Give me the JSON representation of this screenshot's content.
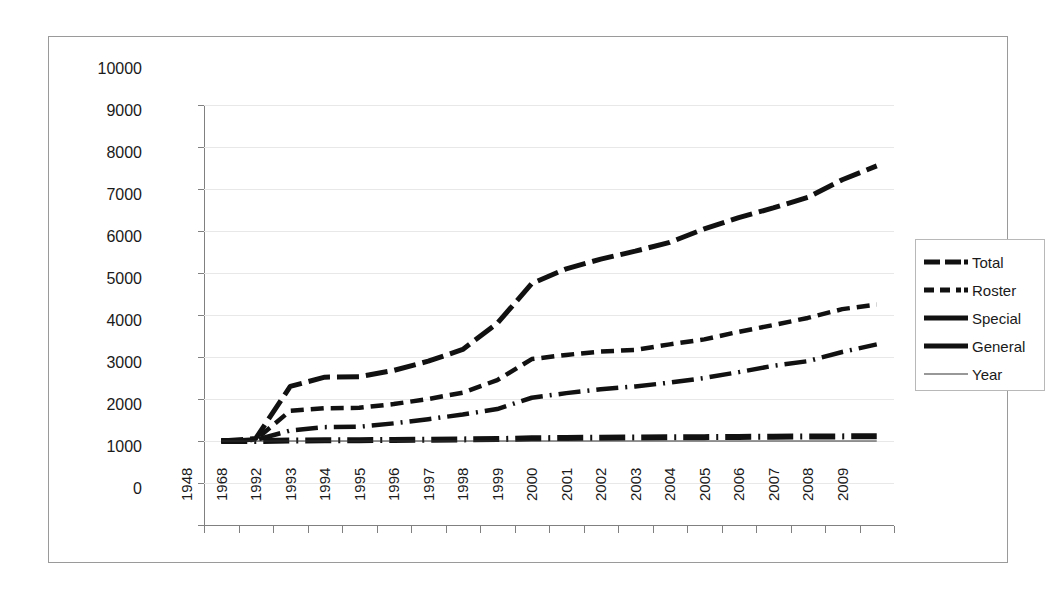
{
  "chart_data": {
    "type": "line",
    "title": "",
    "subtitle": "",
    "xlabel": "",
    "ylabel": "",
    "ylim": [
      0,
      10000
    ],
    "ytick_values": [
      0,
      1000,
      2000,
      3000,
      4000,
      5000,
      6000,
      7000,
      8000,
      9000,
      10000
    ],
    "ytick_labels": [
      "0",
      "1000",
      "2000",
      "3000",
      "4000",
      "5000",
      "6000",
      "7000",
      "8000",
      "9000",
      "10000"
    ],
    "grid": true,
    "legend_position": "right",
    "categories": [
      "1948",
      "1968",
      "1992",
      "1993",
      "1994",
      "1995",
      "1996",
      "1997",
      "1998",
      "1999",
      "2000",
      "2001",
      "2002",
      "2003",
      "2004",
      "2005",
      "2006",
      "2007",
      "2008",
      "2009"
    ],
    "series": [
      {
        "name": "Total",
        "linestyle": "long-dash",
        "linewidth": "thick",
        "color": "#111111",
        "values": [
          2000,
          2060,
          3300,
          3520,
          3530,
          3680,
          3900,
          4180,
          4800,
          5750,
          6100,
          6330,
          6520,
          6730,
          7050,
          7320,
          7550,
          7800,
          8220,
          8550
        ]
      },
      {
        "name": "Roster",
        "linestyle": "dashed",
        "linewidth": "medium",
        "color": "#111111",
        "values": [
          2000,
          2035,
          2720,
          2780,
          2790,
          2880,
          3000,
          3150,
          3450,
          3950,
          4050,
          4130,
          4170,
          4300,
          4420,
          4600,
          4760,
          4930,
          5140,
          5250
        ]
      },
      {
        "name": "Special",
        "linestyle": "dash-dot",
        "linewidth": "medium-thick",
        "color": "#111111",
        "values": [
          2000,
          2025,
          2250,
          2330,
          2340,
          2420,
          2520,
          2630,
          2760,
          3030,
          3140,
          3230,
          3300,
          3390,
          3500,
          3640,
          3790,
          3900,
          4120,
          4300
        ]
      },
      {
        "name": "General",
        "linestyle": "dash-dot-thick",
        "linewidth": "thick",
        "color": "#111111",
        "values": [
          2000,
          2000,
          2010,
          2015,
          2020,
          2025,
          2030,
          2038,
          2045,
          2065,
          2072,
          2078,
          2082,
          2088,
          2092,
          2098,
          2102,
          2106,
          2110,
          2115
        ]
      },
      {
        "name": "Year",
        "linestyle": "solid-thin",
        "linewidth": "thin",
        "color": "#333333",
        "values": [
          1948,
          1968,
          1992,
          1993,
          1994,
          1995,
          1996,
          1997,
          1998,
          1999,
          2000,
          2001,
          2002,
          2003,
          2004,
          2005,
          2006,
          2007,
          2008,
          2009
        ]
      }
    ]
  },
  "legend": {
    "items": [
      {
        "label": "Total"
      },
      {
        "label": "Roster"
      },
      {
        "label": "Special"
      },
      {
        "label": "General"
      },
      {
        "label": "Year"
      }
    ]
  }
}
